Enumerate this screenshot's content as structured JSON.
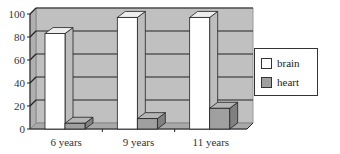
{
  "chart_data": {
    "type": "bar",
    "title": "",
    "xlabel": "",
    "ylabel": "",
    "categories": [
      "6 years",
      "9 years",
      "11 years"
    ],
    "series": [
      {
        "name": "brain",
        "values": [
          83,
          97,
          97
        ],
        "color": "#ffffff"
      },
      {
        "name": "heart",
        "values": [
          5,
          9,
          18
        ],
        "color": "#a0a0a0"
      }
    ],
    "ylim": [
      0,
      100
    ],
    "yticks": [
      0,
      20,
      40,
      60,
      80,
      100
    ],
    "grid": true,
    "legend_position": "right",
    "style": "3d-column"
  },
  "legend": {
    "items": [
      {
        "label": "brain",
        "color": "#ffffff"
      },
      {
        "label": "heart",
        "color": "#a0a0a0"
      }
    ]
  }
}
